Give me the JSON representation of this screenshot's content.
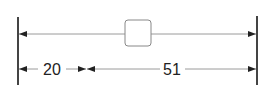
{
  "diagram": {
    "type": "dimension-drawing",
    "colors": {
      "line": "#9a9a9a",
      "bar": "#444444",
      "arrow": "#222222",
      "box": "#888888",
      "text": "#222222"
    },
    "dimensions": [
      {
        "label": "20",
        "from": "left-edge",
        "to": "split-point"
      },
      {
        "label": "51",
        "from": "split-point",
        "to": "right-edge"
      }
    ],
    "top_span": {
      "description": "full width span with centered box"
    }
  }
}
